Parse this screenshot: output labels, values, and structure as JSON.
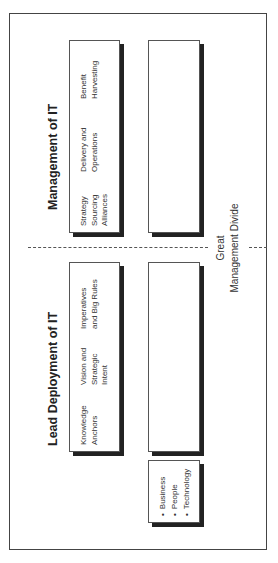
{
  "diagram": {
    "rows": [
      {
        "title": "Lead Deployment of IT",
        "cells": [
          "Knowledge\nAnchors",
          "Vision and\nStrategic\nIntent",
          "Imperatives\nand Big Rules"
        ]
      },
      {
        "title": "Management of IT",
        "cells": [
          "Strategy\nSourcing\nAlliances",
          "Delivery and\nOperations",
          "Benefit\nHarvesting"
        ]
      }
    ],
    "legend_items": [
      "Business",
      "People",
      "Technology"
    ],
    "divider": {
      "line1": "Great",
      "line2": "Management Divide"
    }
  }
}
